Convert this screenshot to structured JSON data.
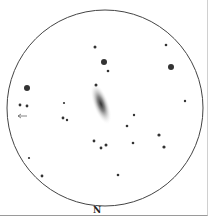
{
  "sketch": {
    "orientation_label": "N",
    "field": {
      "cx": 105,
      "cy": 108,
      "r": 98
    },
    "galaxy": {
      "cx": 101,
      "cy": 104,
      "rx": 8,
      "ry": 22,
      "angle": -20
    },
    "stars": [
      [
        95,
        47,
        1.5
      ],
      [
        104,
        62,
        3
      ],
      [
        108,
        71,
        1.3
      ],
      [
        166,
        45,
        1.3
      ],
      [
        171,
        67,
        3
      ],
      [
        27,
        88,
        3
      ],
      [
        96,
        85,
        1.5
      ],
      [
        185,
        101,
        1.2
      ],
      [
        20,
        105,
        1.4
      ],
      [
        27,
        106,
        1.4
      ],
      [
        64,
        103,
        1.1
      ],
      [
        63,
        118,
        1.4
      ],
      [
        67,
        120,
        1.2
      ],
      [
        134,
        115,
        1.2
      ],
      [
        127,
        126,
        1.3
      ],
      [
        159,
        135,
        1.6
      ],
      [
        164,
        147,
        1.6
      ],
      [
        94,
        141,
        1.4
      ],
      [
        106,
        145,
        1.5
      ],
      [
        101,
        148,
        1.4
      ],
      [
        133,
        143,
        1.3
      ],
      [
        29,
        158,
        1.1
      ],
      [
        42,
        176,
        1.4
      ],
      [
        118,
        175,
        1.3
      ]
    ],
    "arrow": {
      "x": 18,
      "y": 116
    }
  }
}
